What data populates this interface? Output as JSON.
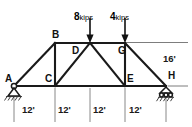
{
  "figure": {
    "type": "truss-free-body-diagram",
    "title": "",
    "joints": [
      {
        "id": "A",
        "label": "A",
        "x": 14,
        "y": 86,
        "label_dx": -10,
        "label_dy": -13
      },
      {
        "id": "B",
        "label": "B",
        "x": 55,
        "y": 43,
        "label_dx": -3,
        "label_dy": -13
      },
      {
        "id": "C",
        "label": "C",
        "x": 55,
        "y": 86,
        "label_dx": -10,
        "label_dy": -13
      },
      {
        "id": "D",
        "label": "D",
        "x": 90,
        "y": 43,
        "label_dx": -12,
        "label_dy": 2
      },
      {
        "id": "E",
        "label": "E",
        "x": 125,
        "y": 86,
        "label_dx": 2,
        "label_dy": -13
      },
      {
        "id": "G",
        "label": "G",
        "x": 125,
        "y": 43,
        "label_dx": -2,
        "label_dy": 2
      },
      {
        "id": "H",
        "label": "H",
        "x": 166,
        "y": 86,
        "label_dx": 2,
        "label_dy": -14
      }
    ],
    "members": [
      {
        "from": "A",
        "to": "B"
      },
      {
        "from": "A",
        "to": "H"
      },
      {
        "from": "B",
        "to": "C"
      },
      {
        "from": "B",
        "to": "G"
      },
      {
        "from": "C",
        "to": "D"
      },
      {
        "from": "D",
        "to": "E"
      },
      {
        "from": "G",
        "to": "E"
      },
      {
        "from": "G",
        "to": "H"
      }
    ],
    "loads": [
      {
        "id": "load-8",
        "magnitude": "8",
        "unit": "kips",
        "at_joint": "D",
        "x": 90,
        "direction": "down",
        "text_x": 74,
        "text_y": 8,
        "tail_y": 18,
        "tip_y": 42
      },
      {
        "id": "load-4",
        "magnitude": "4",
        "unit": "kips",
        "at_joint": "G",
        "x": 125,
        "direction": "down",
        "text_x": 110,
        "text_y": 8,
        "tail_y": 18,
        "tip_y": 42
      }
    ],
    "supports": [
      {
        "id": "support-A",
        "at_joint": "A",
        "type": "pin",
        "x": 14,
        "y": 87
      },
      {
        "id": "support-H",
        "at_joint": "H",
        "type": "roller",
        "x": 166,
        "y": 87
      }
    ],
    "dimensions": {
      "horizontal": {
        "spans": [
          {
            "label": "12'",
            "text_x": 22,
            "text_y": 109
          },
          {
            "label": "12'",
            "text_x": 58,
            "text_y": 109
          },
          {
            "label": "12'",
            "text_x": 93,
            "text_y": 109
          },
          {
            "label": "12'",
            "text_x": 129,
            "text_y": 109
          }
        ],
        "tick_x": [
          14,
          55,
          90,
          125,
          166
        ],
        "tick_top": 88,
        "tick_bottom": 122
      },
      "vertical": {
        "label": "16'",
        "text_x": 163,
        "text_y": 59,
        "value": "16'",
        "from_y": 43,
        "to_y": 86
      }
    },
    "colors": {
      "member": "#1a1a1a",
      "thin": "#6e6e6e",
      "text": "#111111",
      "background": "#ffffff"
    }
  }
}
